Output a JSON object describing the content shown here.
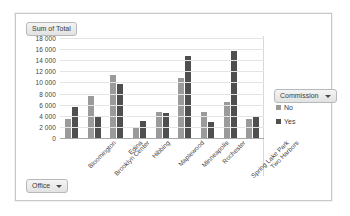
{
  "chart_object": {
    "value_field_button": "Sum of Total",
    "axis_field_button": "Office",
    "legend_field_button": "Commission",
    "caret_icon": "chevron-down-icon"
  },
  "legend": {
    "title": "Commission",
    "entries": [
      {
        "label": "No",
        "color": "#9a9a9a"
      },
      {
        "label": "Yes",
        "color": "#4f4f4f"
      }
    ]
  },
  "chart_data": {
    "type": "bar",
    "title": "Sum of Total",
    "xlabel": "Office",
    "ylabel": "",
    "ylim": [
      0,
      18000
    ],
    "ytick_step": 2000,
    "ytick_labels": [
      "18 000",
      "16 000",
      "14 000",
      "12 000",
      "10 000",
      "8 000",
      "6 000",
      "4 000",
      "2 000",
      "0"
    ],
    "ytick_values": [
      18000,
      16000,
      14000,
      12000,
      10000,
      8000,
      6000,
      4000,
      2000,
      0
    ],
    "grid": true,
    "legend_position": "right",
    "legend_title": "Commission",
    "categories": [
      "Bloomington",
      "Brooklyn Center",
      "Edina",
      "Hibbing",
      "Maplewood",
      "Minneapolis",
      "Rochester",
      "Spring Lake Park",
      "Two Harbors"
    ],
    "series": [
      {
        "name": "No",
        "color": "#9a9a9a",
        "values": [
          3400,
          7600,
          11400,
          1900,
          4750,
          10800,
          4700,
          6400,
          3400
        ]
      },
      {
        "name": "Yes",
        "color": "#4f4f4f",
        "values": [
          5500,
          3700,
          9700,
          3100,
          4500,
          14800,
          2900,
          15700,
          4000
        ]
      }
    ]
  }
}
